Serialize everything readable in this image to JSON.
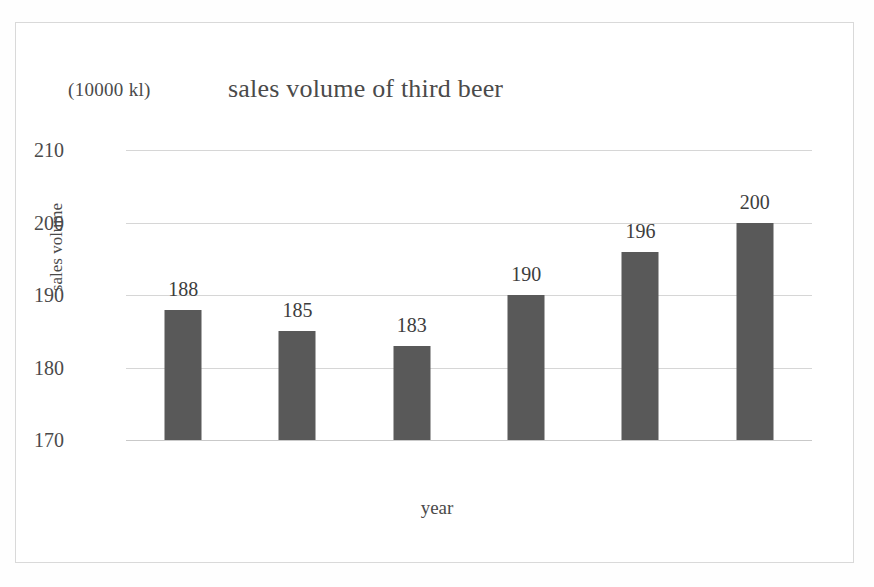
{
  "chart_data": {
    "type": "bar",
    "title": "sales volume of third beer",
    "unit_label": "(10000 kl)",
    "xlabel": "year",
    "ylabel": "sales volume",
    "categories": [
      "2015",
      "2016",
      "2017",
      "2018",
      "2019",
      "2020"
    ],
    "values": [
      188,
      185,
      183,
      190,
      196,
      200
    ],
    "value_labels": [
      "188",
      "185",
      "183",
      "190",
      "196",
      "200"
    ],
    "ylim": [
      170,
      210
    ],
    "yticks": [
      210,
      200,
      190,
      180,
      170
    ],
    "ytick_labels": [
      "210",
      "200",
      "190",
      "180",
      "170"
    ],
    "grid": true,
    "legend": "none",
    "bar_color": "#595959",
    "gridline_color": "#d6d6d6",
    "frame_color": "#d9d9d9",
    "text_color": "#4a4a4a"
  }
}
